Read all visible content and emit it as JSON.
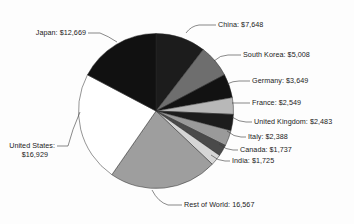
{
  "chart_data": {
    "type": "pie",
    "title": "",
    "subtitle": "",
    "xlabel": "",
    "ylabel": "",
    "legend_position": "callout-labels",
    "grid": false,
    "total": 73352,
    "units": "USD (billions)",
    "start_angle_deg": 0,
    "direction": "clockwise",
    "categories": [
      "China",
      "South Korea",
      "Germany",
      "France",
      "United Kingdom",
      "Italy",
      "Canada",
      "India",
      "Rest of World",
      "United States",
      "Japan"
    ],
    "values": [
      7648,
      5008,
      3649,
      2549,
      2483,
      2388,
      1737,
      1725,
      16567,
      16929,
      12669
    ],
    "labels": [
      "China: $7,648",
      "South Korea: $5,008",
      "Germany: $3,649",
      "France: $2,549",
      "United Kingdom: $2,483",
      "Italy: $2,388",
      "Canada: $1,737",
      "India: $1,725",
      "Rest of World: 16,567",
      "United States:",
      "Japan: $12,669"
    ],
    "slice_colors": [
      "#1c1c1c",
      "#6e6e6e",
      "#121212",
      "#b8b8b8",
      "#1c1c1c",
      "#9a9a9a",
      "#4a4a4a",
      "#d6d6d6",
      "#9e9e9e",
      "#ffffff",
      "#111111"
    ]
  },
  "labels": {
    "china": "China: $7,648",
    "south_korea": "South Korea: $5,008",
    "germany": "Germany: $3,649",
    "france": "France: $2,549",
    "united_kingdom": "United Kingdom: $2,483",
    "italy": "Italy: $2,388",
    "canada": "Canada: $1,737",
    "india": "India: $1,725",
    "rest_of_world": "Rest of World: 16,567",
    "united_states_line1": "United States:",
    "united_states_line2": "$16,929",
    "japan": "Japan: $12,669"
  }
}
